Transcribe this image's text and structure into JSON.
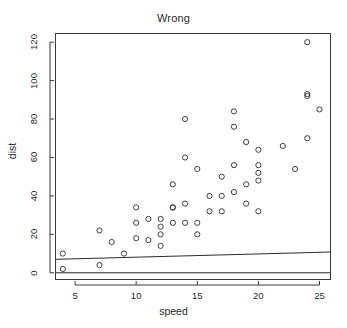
{
  "chart_data": {
    "type": "scatter",
    "title": "Wrong",
    "xlabel": "speed",
    "ylabel": "dist",
    "xlim": [
      3.4,
      25.9
    ],
    "ylim": [
      -3.5,
      124.5
    ],
    "grid": false,
    "legend": "none",
    "marker": "open-circle",
    "x": [
      4,
      4,
      7,
      7,
      8,
      9,
      10,
      10,
      10,
      11,
      11,
      12,
      12,
      12,
      12,
      13,
      13,
      13,
      13,
      14,
      14,
      14,
      14,
      15,
      15,
      15,
      16,
      16,
      17,
      17,
      17,
      18,
      18,
      18,
      18,
      19,
      19,
      19,
      20,
      20,
      20,
      20,
      20,
      22,
      23,
      24,
      24,
      24,
      24,
      25
    ],
    "y": [
      2,
      10,
      4,
      22,
      16,
      10,
      18,
      26,
      34,
      17,
      28,
      14,
      20,
      24,
      28,
      26,
      34,
      34,
      46,
      26,
      36,
      60,
      80,
      20,
      26,
      54,
      32,
      40,
      32,
      40,
      50,
      42,
      56,
      76,
      84,
      36,
      46,
      68,
      32,
      48,
      52,
      56,
      64,
      66,
      54,
      70,
      92,
      93,
      120,
      85
    ],
    "xticks": [
      5,
      10,
      15,
      20,
      25
    ],
    "yticks": [
      0,
      20,
      40,
      60,
      80,
      100,
      120
    ],
    "lines": [
      {
        "name": "fit-line-upper",
        "x0": 3.4,
        "y0": 7.0,
        "x1": 25.9,
        "y1": 10.8
      },
      {
        "name": "fit-line-lower",
        "x0": 3.4,
        "y0": 0.0,
        "x1": 25.9,
        "y1": 0.0
      }
    ]
  },
  "colors": {
    "marker_stroke": "#2b2b2b",
    "axis": "#3a3a3a",
    "background": "#ffffff",
    "line": "#2b2b2b"
  }
}
